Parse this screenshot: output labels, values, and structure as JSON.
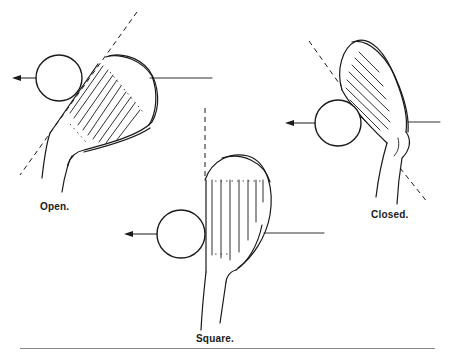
{
  "figure": {
    "type": "golf clubface positions at impact",
    "panels": [
      {
        "id": "open",
        "label": "Open.",
        "ball_direction": "left",
        "face_line": "dashed diagonal tilted right"
      },
      {
        "id": "square",
        "label": "Square.",
        "ball_direction": "left",
        "face_line": "dashed vertical"
      },
      {
        "id": "closed",
        "label": "Closed.",
        "ball_direction": "left",
        "face_line": "dashed diagonal tilted left"
      }
    ],
    "icons": {
      "ball": "circle",
      "direction": "left-arrow",
      "club": "iron-clubhead"
    },
    "colors": {
      "ink": "#1a1a1a",
      "divider": "#8a8a8a",
      "background": "#ffffff"
    }
  }
}
